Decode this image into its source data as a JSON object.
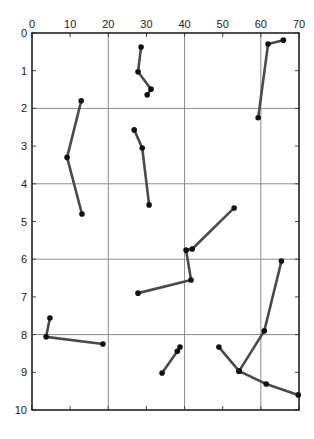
{
  "chart_data": {
    "type": "line",
    "title": "",
    "xlabel": "",
    "ylabel": "",
    "xlim": [
      0,
      70
    ],
    "ylim": [
      0,
      10
    ],
    "y_inverted": true,
    "x_axis_position": "top",
    "grid": true,
    "x_ticks": [
      0,
      10,
      20,
      30,
      40,
      50,
      60,
      70
    ],
    "y_ticks": [
      0,
      1,
      2,
      3,
      4,
      5,
      6,
      7,
      8,
      9,
      10
    ],
    "x_gridlines": [
      20,
      40,
      60
    ],
    "y_gridlines": [
      2,
      4,
      6,
      8
    ],
    "line_color": "#4a4a4a",
    "marker_color": "#111111",
    "series": [
      {
        "name": "track-1",
        "points": [
          [
            12.9,
            1.8
          ],
          [
            9.2,
            3.3
          ],
          [
            13.1,
            4.8
          ]
        ]
      },
      {
        "name": "track-2",
        "points": [
          [
            28.6,
            0.37
          ],
          [
            27.8,
            1.03
          ],
          [
            31.2,
            1.49
          ],
          [
            30.2,
            1.64
          ]
        ]
      },
      {
        "name": "track-3",
        "points": [
          [
            65.9,
            0.19
          ],
          [
            61.9,
            0.29
          ],
          [
            59.3,
            2.25
          ]
        ]
      },
      {
        "name": "track-4",
        "points": [
          [
            26.8,
            2.57
          ],
          [
            28.9,
            3.05
          ],
          [
            30.7,
            4.56
          ]
        ]
      },
      {
        "name": "track-5",
        "points": [
          [
            53.0,
            4.64
          ],
          [
            42.0,
            5.73
          ],
          [
            40.4,
            5.76
          ],
          [
            41.7,
            6.55
          ],
          [
            27.8,
            6.9
          ]
        ]
      },
      {
        "name": "track-6",
        "points": [
          [
            4.7,
            7.56
          ],
          [
            3.7,
            8.06
          ],
          [
            18.6,
            8.25
          ]
        ]
      },
      {
        "name": "track-7",
        "points": [
          [
            34.1,
            9.02
          ],
          [
            38.1,
            8.44
          ],
          [
            38.8,
            8.33
          ]
        ]
      },
      {
        "name": "track-8",
        "points": [
          [
            65.4,
            6.05
          ],
          [
            60.9,
            7.9
          ],
          [
            54.3,
            8.97
          ]
        ]
      },
      {
        "name": "track-9",
        "points": [
          [
            49.0,
            8.33
          ],
          [
            54.3,
            8.97
          ],
          [
            61.4,
            9.31
          ],
          [
            69.8,
            9.6
          ]
        ]
      }
    ]
  }
}
